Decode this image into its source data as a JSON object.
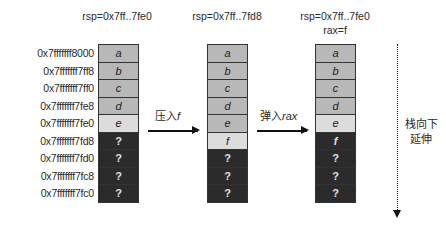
{
  "addresses": [
    "0x7fffffff8000",
    "0x7fffffff7ff8",
    "0x7fffffff7ff0",
    "0x7fffffff7fe8",
    "0x7fffffff7fe0",
    "0x7fffffff7fd8",
    "0x7fffffff7fd0",
    "0x7fffffff7fc8",
    "0x7fffffff7fc0"
  ],
  "stacks": [
    {
      "rsp": "rsp=0x7ff..7fe0",
      "rax": "",
      "cells": [
        "a",
        "b",
        "c",
        "d",
        "e",
        "?",
        "?",
        "?",
        "?",
        "?"
      ]
    },
    {
      "rsp": "rsp=0x7ff..7fd8",
      "rax": "",
      "cells": [
        "a",
        "b",
        "c",
        "d",
        "e",
        "f",
        "?",
        "?",
        "?",
        "?"
      ]
    },
    {
      "rsp": "rsp=0x7ff..7fe0",
      "rax": "rax=f",
      "cells": [
        "a",
        "b",
        "c",
        "d",
        "e",
        "f",
        "?",
        "?",
        "?",
        "?"
      ]
    }
  ],
  "operations": {
    "push": {
      "prefix": "压入",
      "operand": "f"
    },
    "pop": {
      "prefix": "弹入",
      "operand": "rax"
    }
  },
  "growth_note": {
    "line1": "栈向下",
    "line2": "延伸"
  },
  "colors": {
    "data_cell": "#b8b8b8",
    "top_cell": "#dcdcdc",
    "unused_cell": "#2b2b2b"
  }
}
